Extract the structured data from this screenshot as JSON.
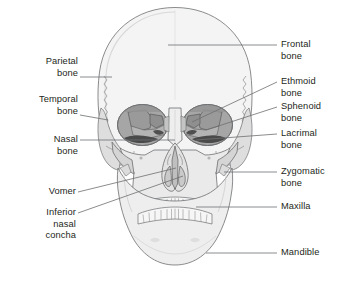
{
  "figure": {
    "background_color": "#ffffff",
    "line_color": "#6d6e71",
    "text_color": "#231f20",
    "bone_fill": "#f2f2f2",
    "bone_fill_mid": "#e3e3e3",
    "bone_fill_dark": "#c9c9c9",
    "orbit_fill": "#a8a8a8",
    "orbit_fill_dark": "#8a8a8a",
    "cavity_fill": "#5f5f5f"
  },
  "labels": {
    "left": [
      {
        "id": "parietal-bone",
        "lines": [
          "Parietal",
          "bone"
        ]
      },
      {
        "id": "temporal-bone",
        "lines": [
          "Temporal",
          "bone"
        ]
      },
      {
        "id": "nasal-bone",
        "lines": [
          "Nasal",
          "bone"
        ]
      },
      {
        "id": "vomer",
        "lines": [
          "Vomer"
        ]
      },
      {
        "id": "inferior-nasal-concha",
        "lines": [
          "Inferior",
          "nasal",
          "concha"
        ]
      }
    ],
    "right": [
      {
        "id": "frontal-bone",
        "lines": [
          "Frontal",
          "bone"
        ]
      },
      {
        "id": "ethmoid-bone",
        "lines": [
          "Ethmoid",
          "bone"
        ]
      },
      {
        "id": "sphenoid-bone",
        "lines": [
          "Sphenoid",
          "bone"
        ]
      },
      {
        "id": "lacrimal-bone",
        "lines": [
          "Lacrimal",
          "bone"
        ]
      },
      {
        "id": "zygomatic-bone",
        "lines": [
          "Zygomatic",
          "bone"
        ]
      },
      {
        "id": "maxilla",
        "lines": [
          "Maxilla"
        ]
      },
      {
        "id": "mandible",
        "lines": [
          "Mandible"
        ]
      }
    ]
  },
  "text": {
    "parietal_l1": "Parietal",
    "parietal_l2": "bone",
    "temporal_l1": "Temporal",
    "temporal_l2": "bone",
    "nasal_l1": "Nasal",
    "nasal_l2": "bone",
    "vomer_l1": "Vomer",
    "inferior_l1": "Inferior",
    "inferior_l2": "nasal",
    "inferior_l3": "concha",
    "frontal_l1": "Frontal",
    "frontal_l2": "bone",
    "ethmoid_l1": "Ethmoid",
    "ethmoid_l2": "bone",
    "sphenoid_l1": "Sphenoid",
    "sphenoid_l2": "bone",
    "lacrimal_l1": "Lacrimal",
    "lacrimal_l2": "bone",
    "zygomatic_l1": "Zygomatic",
    "zygomatic_l2": "bone",
    "maxilla_l1": "Maxilla",
    "mandible_l1": "Mandible"
  }
}
